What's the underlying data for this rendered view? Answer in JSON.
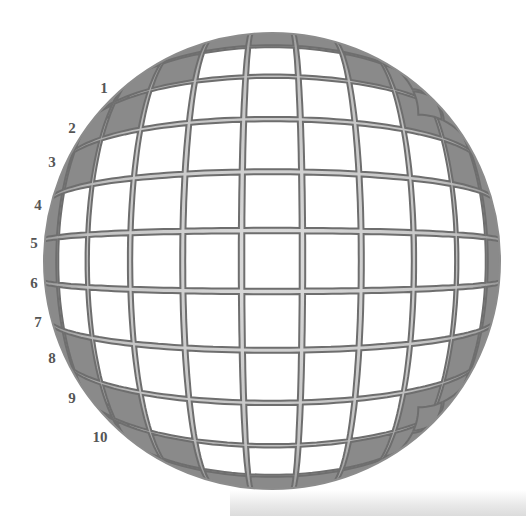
{
  "diagram": {
    "grid_columns": 11,
    "grid_rows": 11,
    "row_labels": [
      "1",
      "2",
      "3",
      "4",
      "5",
      "6",
      "7",
      "8",
      "9",
      "10"
    ],
    "colors": {
      "background": "#ffffff",
      "tile_center": "#ffffff",
      "tile_edge": "#8a8a8a",
      "grout": "#d6d6d6",
      "tile_outline": "#6e6e6e",
      "label": "#555555"
    }
  }
}
